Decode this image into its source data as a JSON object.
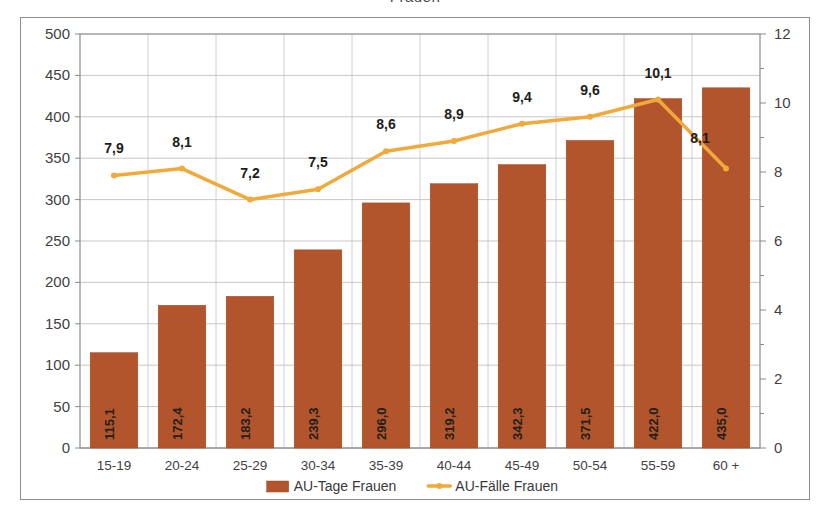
{
  "chart_data": {
    "type": "bar",
    "title": "Frauen",
    "categories": [
      "15-19",
      "20-24",
      "25-29",
      "30-34",
      "35-39",
      "40-44",
      "45-49",
      "50-54",
      "55-59",
      "60 +"
    ],
    "series": [
      {
        "name": "AU-Tage Frauen",
        "type": "bar",
        "axis": "left",
        "color": "#b2552c",
        "values": [
          115.1,
          172.4,
          183.2,
          239.3,
          296.0,
          319.2,
          342.3,
          371.5,
          422.0,
          435.0
        ],
        "labels": [
          "115,1",
          "172,4",
          "183,2",
          "239,3",
          "296,0",
          "319,2",
          "342,3",
          "371,5",
          "422,0",
          "435,0"
        ]
      },
      {
        "name": "AU-Fälle Frauen",
        "type": "line",
        "axis": "right",
        "color": "#f0a93b",
        "values": [
          7.9,
          8.1,
          7.2,
          7.5,
          8.6,
          8.9,
          9.4,
          9.6,
          10.1,
          8.1
        ],
        "labels": [
          "7,9",
          "8,1",
          "7,2",
          "7,5",
          "8,6",
          "8,9",
          "9,4",
          "9,6",
          "10,1",
          "8,1"
        ]
      }
    ],
    "xlabel": "",
    "ylabel": "",
    "y_left": {
      "min": 0,
      "max": 500,
      "step": 50,
      "ticks": [
        "0",
        "50",
        "100",
        "150",
        "200",
        "250",
        "300",
        "350",
        "400",
        "450",
        "500"
      ]
    },
    "y_right": {
      "min": 0,
      "max": 12,
      "step": 2,
      "minor_step": 1,
      "ticks": [
        "0",
        "2",
        "4",
        "6",
        "8",
        "10",
        "12"
      ]
    },
    "grid": true,
    "legend_position": "bottom"
  },
  "legend": {
    "items": [
      {
        "label": "AU-Tage Frauen",
        "marker": "bar-swatch",
        "color": "#b2552c"
      },
      {
        "label": "AU-Fälle Frauen",
        "marker": "line-swatch",
        "color": "#f0a93b"
      }
    ]
  }
}
